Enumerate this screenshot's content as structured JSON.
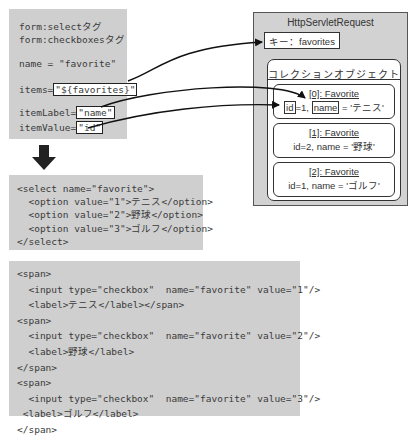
{
  "tag_box": {
    "line1": "form:selectタグ",
    "line2": "form:checkboxesタグ",
    "name_attr": "name = \"favorite\"",
    "items_label": "items=",
    "items_value": "\"${favorites}\"",
    "itemLabel_label": "itemLabel=",
    "itemLabel_value": "\"name\"",
    "itemValue_label": "itemValue=",
    "itemValue_value": "\"id\""
  },
  "arrow": {
    "icon": "arrow-down-icon"
  },
  "select_output": {
    "lines": [
      "<select name=\"favorite\">",
      "  <option value=\"1\">テニス</option>",
      "  <option value=\"2\">野球</option>",
      "  <option value=\"3\">ゴルフ</option>",
      "</select>"
    ]
  },
  "checkbox_output": {
    "lines": [
      "<span>",
      "  <input type=\"checkbox\"  name=\"favorite\" value=\"1\"/>",
      "  <label>テニス</label></span>",
      "<span>",
      "  <input type=\"checkbox\"  name=\"favorite\" value=\"2\"/>",
      "  <label>野球</label>",
      "</span>",
      "<span>",
      "  <input type=\"checkbox\"  name=\"favorite\" value=\"3\"/>",
      " <label>ゴルフ</label>",
      "</span>"
    ]
  },
  "request": {
    "title": "HttpServletRequest",
    "key": "キー：favorites",
    "collection_title": "コレクションオブジェクト",
    "items": [
      {
        "title": "[0]: Favorite",
        "id_part": "id",
        "rest1": "=1, ",
        "name_part": "name",
        "rest2": " = 'テニス'"
      },
      {
        "title": "[1]: Favorite",
        "detail": "id=2, name = '野球'"
      },
      {
        "title": "[2]: Favorite",
        "detail": "id=1, name = 'ゴルフ'"
      }
    ]
  }
}
